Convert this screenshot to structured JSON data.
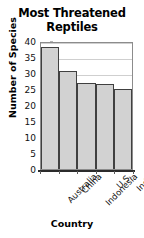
{
  "chart_data": {
    "type": "bar",
    "title": "Most Threatened Reptiles",
    "title_line1": "Most Threatened",
    "title_line2": "Reptiles",
    "xlabel": "Country",
    "ylabel": "Number of Species",
    "categories": [
      "Australia",
      "China",
      "Indonesia",
      "U.S.",
      "India"
    ],
    "values": [
      38,
      30.5,
      27,
      26.5,
      25
    ],
    "ylim": [
      0,
      40
    ],
    "ytick_labels": [
      "40",
      "35",
      "30",
      "25",
      "20",
      "15",
      "10",
      "5",
      "0"
    ],
    "ytick_values": [
      40,
      35,
      30,
      25,
      20,
      15,
      10,
      5,
      0
    ],
    "ytick_step": 5,
    "grid": true,
    "legend": "none",
    "bar_fill_color": "#d2d2d2",
    "bar_edge_color": "#404040",
    "grid_color": "#cfcfcf",
    "axis_color": "#2b2b2b",
    "background_color": "#ffffff",
    "x_label_rotation": -45
  }
}
